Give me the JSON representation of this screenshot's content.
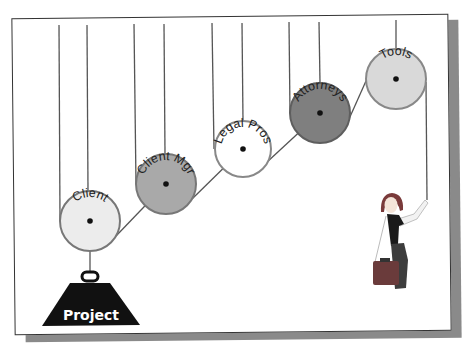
{
  "diagram": {
    "type": "pulley-system",
    "pulleys": [
      {
        "label": "Client",
        "cx": 90,
        "cy": 221,
        "r": 30,
        "fill": "#ececec"
      },
      {
        "label": "Client Mgr",
        "cx": 166,
        "cy": 184,
        "r": 30,
        "fill": "#a9a9a9"
      },
      {
        "label": "Legal Pros",
        "cx": 243,
        "cy": 149,
        "r": 28,
        "fill": "#ffffff"
      },
      {
        "label": "Attorneys",
        "cx": 320,
        "cy": 113,
        "r": 30,
        "fill": "#7f7f7f"
      },
      {
        "label": "Tools",
        "cx": 396,
        "cy": 79,
        "r": 30,
        "fill": "#d9d9d9"
      }
    ],
    "weight": {
      "label": "Project",
      "color": "#111111"
    },
    "figure": {
      "description": "woman with briefcase pulling rope"
    }
  },
  "colors": {
    "frame_border": "#333333",
    "shadow": "#8a8a8a",
    "rope": "#555555",
    "pulley_outline": "#6f6f6f"
  }
}
